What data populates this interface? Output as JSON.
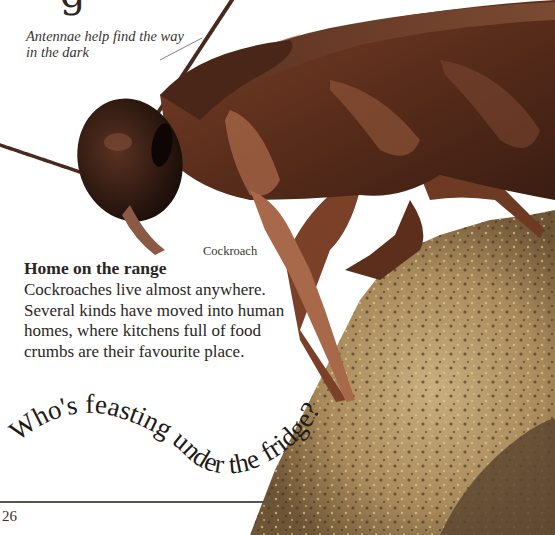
{
  "page": {
    "heading_fragment": "g",
    "annotation": "Antennae help find the way in the dark",
    "caption": "Cockroach",
    "section": {
      "title": "Home on the range",
      "body": "Cockroaches live almost anywhere. Several kinds have moved into human homes, where kitchens full of food crumbs are their favourite place."
    },
    "curved_heading": "Who's feasting under the fridge?",
    "page_number": "26"
  },
  "colors": {
    "background": "#ffffff",
    "text": "#2a2622",
    "cockroach_dark": "#3b1f14",
    "cockroach_mid": "#6e3a24",
    "cockroach_light": "#a8684a",
    "crumb": "#b59a6a",
    "crumb_dark": "#6b5433",
    "rule": "#5a544e"
  }
}
